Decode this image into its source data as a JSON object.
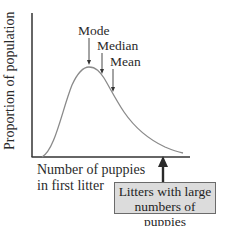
{
  "figure": {
    "y_axis_label": "Proportion of population",
    "x_axis_label_line1": "Number of puppies",
    "x_axis_label_line2": "in first litter",
    "annotations": {
      "mode": "Mode",
      "median": "Median",
      "mean": "Mean"
    },
    "callout": {
      "line1": "Litters with large",
      "line2": "numbers of puppies"
    },
    "colors": {
      "axis": "#333333",
      "curve": "#8a8a8a",
      "callout_fill": "#dcdcdc",
      "callout_border": "#6b6b6b",
      "arrow": "#2a2a2a"
    }
  }
}
